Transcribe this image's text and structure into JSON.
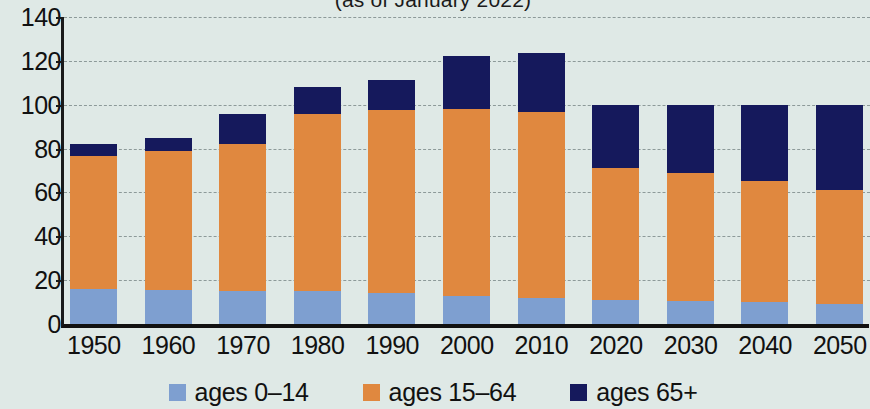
{
  "chart_data": {
    "type": "bar",
    "title": "(as of January 2022)",
    "xlabel": "",
    "ylabel": "",
    "ylim": [
      0,
      140
    ],
    "yticks": [
      0,
      20,
      40,
      60,
      80,
      100,
      120,
      140
    ],
    "grid": true,
    "stacked": true,
    "legend_position": "bottom",
    "categories": [
      "1950",
      "1960",
      "1970",
      "1980",
      "1990",
      "2000",
      "2010",
      "2020",
      "2030",
      "2040",
      "2050"
    ],
    "series": [
      {
        "name": "ages 0–14",
        "color": "#7e9fd0",
        "values": [
          16,
          15.5,
          15,
          15,
          14,
          13,
          12,
          11,
          10.5,
          10,
          9
        ]
      },
      {
        "name": "ages 15–64",
        "color": "#e0883f",
        "values": [
          60.5,
          63.5,
          67,
          81,
          83.5,
          85,
          84.5,
          60,
          58.5,
          55,
          52
        ]
      },
      {
        "name": "ages 65+",
        "color": "#15195c",
        "values": [
          5.5,
          6,
          14,
          12,
          14,
          24,
          27,
          29,
          31,
          35,
          39
        ]
      }
    ],
    "totals": [
      82,
      85,
      96,
      108,
      111.5,
      122,
      123.5,
      100,
      100,
      100,
      100
    ]
  },
  "legend": {
    "items": [
      {
        "label": "ages 0–14",
        "color": "#7e9fd0"
      },
      {
        "label": "ages 15–64",
        "color": "#e0883f"
      },
      {
        "label": "ages 65+",
        "color": "#15195c"
      }
    ]
  },
  "colors": {
    "background": "#dfe9e6",
    "plot_background": "#e2ebe8",
    "axis": "#111111",
    "grid": "#8d9a99"
  }
}
